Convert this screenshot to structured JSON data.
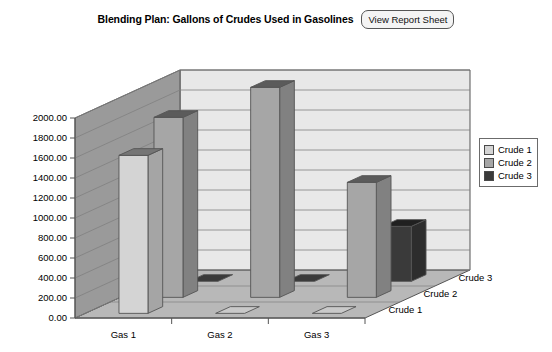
{
  "header": {
    "title": "Blending Plan: Gallons of Crudes Used in Gasolines",
    "report_button_label": "View Report Sheet"
  },
  "legend": {
    "items": [
      {
        "label": "Crude 1",
        "color": "#d4d4d4",
        "icon": "legend-swatch-icon"
      },
      {
        "label": "Crude 2",
        "color": "#a6a6a6",
        "icon": "legend-swatch-icon"
      },
      {
        "label": "Crude 3",
        "color": "#3a3a3a",
        "icon": "legend-swatch-icon"
      }
    ]
  },
  "colors": {
    "back_wall": "#e8e8e8",
    "left_wall": "#9a9a9a",
    "floor": "#b8b8b8",
    "gridline": "#808080",
    "outline": "#555555",
    "crude1": "#d4d4d4",
    "crude2": "#a6a6a6",
    "crude3": "#3a3a3a",
    "text": "#000000"
  },
  "axes": {
    "y_ticks": [
      "2000.00",
      "1800.00",
      "1600.00",
      "1400.00",
      "1200.00",
      "1000.00",
      "800.00",
      "600.00",
      "400.00",
      "200.00",
      "0.00"
    ],
    "x_categories": [
      "Gas 1",
      "Gas 2",
      "Gas 3"
    ],
    "z_categories": [
      "Crude 1",
      "Crude 2",
      "Crude 3"
    ]
  },
  "chart_data": {
    "type": "bar",
    "title": "Blending Plan: Gallons of Crudes Used in Gasolines",
    "subtitle": "",
    "xlabel": "",
    "ylabel": "",
    "zlabel": "",
    "is_3d": true,
    "grid": true,
    "legend_position": "right",
    "categories": [
      "Gas 1",
      "Gas 2",
      "Gas 3"
    ],
    "ylim": [
      0,
      2000
    ],
    "ytick_step": 200,
    "series": [
      {
        "name": "Crude 1",
        "color": "#d4d4d4",
        "values": [
          1580,
          0,
          0
        ]
      },
      {
        "name": "Crude 2",
        "color": "#a6a6a6",
        "values": [
          1800,
          2100,
          1150
        ]
      },
      {
        "name": "Crude 3",
        "color": "#3a3a3a",
        "values": [
          0,
          0,
          550
        ]
      }
    ]
  }
}
